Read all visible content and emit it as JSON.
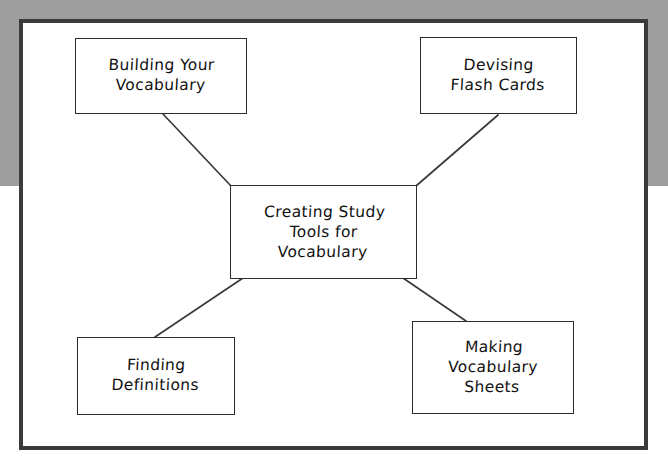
{
  "canvas": {
    "width": 668,
    "height": 473,
    "background_color": "#ffffff",
    "backdrop_color": "#9e9e9e",
    "page_border_color": "#3b3b3b",
    "node_border_color": "#2b2b2b",
    "node_fill_color": "#ffffff",
    "connector_color": "#3a3a3a",
    "text_color": "#111111"
  },
  "diagram": {
    "type": "concept-map",
    "center": {
      "id": "creating-study-tools",
      "lines": [
        "Creating  Study",
        "Tools  for",
        "Vocabulary"
      ],
      "text": "Creating Study Tools for Vocabulary"
    },
    "nodes": [
      {
        "id": "building-vocabulary",
        "position": "top-left",
        "lines": [
          "Building  Your",
          "Vocabulary"
        ],
        "text": "Building Your Vocabulary"
      },
      {
        "id": "devising-flash-cards",
        "position": "top-right",
        "lines": [
          "Devising",
          "Flash Cards"
        ],
        "text": "Devising Flash Cards"
      },
      {
        "id": "finding-definitions",
        "position": "bottom-left",
        "lines": [
          "Finding",
          "Definitions"
        ],
        "text": "Finding Definitions"
      },
      {
        "id": "making-vocabulary-sheets",
        "position": "bottom-right",
        "lines": [
          "Making",
          "Vocabulary",
          "Sheets"
        ],
        "text": "Making Vocabulary Sheets"
      }
    ],
    "connectors": [
      {
        "id": "center-to-building-vocabulary",
        "from": "creating-study-tools",
        "to": "building-vocabulary",
        "x1": 231,
        "y1": 186,
        "x2": 163,
        "y2": 114
      },
      {
        "id": "center-to-devising-flash-cards",
        "from": "creating-study-tools",
        "to": "devising-flash-cards",
        "x1": 416,
        "y1": 186,
        "x2": 498,
        "y2": 115
      },
      {
        "id": "center-to-finding-definitions",
        "from": "creating-study-tools",
        "to": "finding-definitions",
        "x1": 243,
        "y1": 278,
        "x2": 155,
        "y2": 337
      },
      {
        "id": "center-to-making-vocabulary-sheets",
        "from": "creating-study-tools",
        "to": "making-vocabulary-sheets",
        "x1": 403,
        "y1": 278,
        "x2": 466,
        "y2": 321
      }
    ]
  }
}
